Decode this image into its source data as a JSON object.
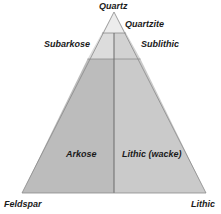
{
  "diagram": {
    "type": "ternary-classification",
    "vertices": {
      "top": "Quartz",
      "bottom_left": "Feldspar",
      "bottom_right": "Lithic"
    },
    "regions": [
      {
        "id": "quartzite",
        "label": "Quartzite",
        "color": "#ececec"
      },
      {
        "id": "subarkose",
        "label": "Subarkose",
        "color": "#dcdcdc"
      },
      {
        "id": "sublithic",
        "label": "Sublithic",
        "color": "#d2d2d2"
      },
      {
        "id": "arkose",
        "label": "Arkose",
        "color": "#bcbcbc"
      },
      {
        "id": "lithic-wacke",
        "label": "Lithic (wacke)",
        "color": "#cacaca"
      }
    ],
    "line_color": "#707070"
  }
}
